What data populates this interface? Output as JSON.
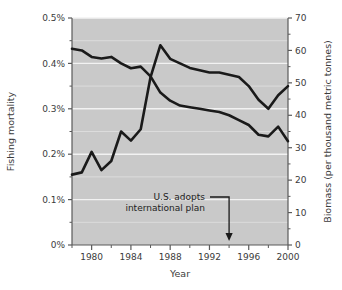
{
  "chart_data": {
    "type": "line",
    "title": "",
    "xlabel": "Year",
    "ylabel": "Fishing mortality",
    "y2label": "Biomass (per thousand metric tonnes)",
    "xlim": [
      1978,
      2000
    ],
    "ylim": [
      0,
      0.5
    ],
    "y2lim": [
      0,
      70
    ],
    "grid": true,
    "legend": "none",
    "xticks": [
      1980,
      1984,
      1988,
      1992,
      1996,
      2000
    ],
    "xtick_labels": [
      "1980",
      "1984",
      "1988",
      "1992",
      "1996",
      "2000"
    ],
    "xminor_ticks": [
      1978,
      1982,
      1986,
      1990,
      1994,
      1998
    ],
    "yticks": [
      0,
      0.1,
      0.2,
      0.3,
      0.4,
      0.5
    ],
    "ytick_labels": [
      "0%",
      "0.1%",
      "0.2%",
      "0.3%",
      "0.4%",
      "0.5%"
    ],
    "yminor_ticks": [
      0.05,
      0.15,
      0.25,
      0.35,
      0.45
    ],
    "y2ticks": [
      0,
      10,
      20,
      30,
      40,
      50,
      60,
      70
    ],
    "y2tick_labels": [
      "0",
      "10",
      "20",
      "30",
      "40",
      "50",
      "60",
      "70"
    ],
    "y2minor_ticks": [
      5,
      15,
      25,
      35,
      45,
      55,
      65
    ],
    "plot_bg": "#c9c9c9",
    "gridline_color": "#e8e8e8",
    "line_color": "#1a1a1a",
    "series": [
      {
        "name": "Fishing mortality",
        "axis": "left",
        "x": [
          1978,
          1979,
          1980,
          1981,
          1982,
          1983,
          1984,
          1985,
          1986,
          1987,
          1988,
          1989,
          1990,
          1991,
          1992,
          1993,
          1994,
          1995,
          1996,
          1997,
          1998,
          1999,
          2000
        ],
        "values": [
          0.155,
          0.16,
          0.205,
          0.165,
          0.185,
          0.25,
          0.23,
          0.255,
          0.37,
          0.44,
          0.41,
          0.4,
          0.39,
          0.385,
          0.38,
          0.38,
          0.375,
          0.37,
          0.35,
          0.32,
          0.3,
          0.33,
          0.35
        ]
      },
      {
        "name": "Biomass",
        "axis": "right",
        "x": [
          1978,
          1979,
          1980,
          1981,
          1982,
          1983,
          1984,
          1985,
          1986,
          1987,
          1988,
          1989,
          1990,
          1991,
          1992,
          1993,
          1994,
          1995,
          1996,
          1997,
          1998,
          1999,
          2000
        ],
        "values": [
          60.5,
          60.0,
          58.0,
          57.5,
          58.0,
          56.0,
          54.5,
          55.0,
          52.0,
          47.0,
          44.5,
          43.0,
          42.5,
          42.0,
          41.5,
          41.0,
          40.0,
          38.5,
          37.0,
          34.0,
          33.5,
          36.5,
          32.0
        ]
      }
    ],
    "annotations": [
      {
        "name": "us-adopts-plan",
        "line1": "U.S. adopts",
        "line2": "international plan",
        "target_x": 1994,
        "arrow": "down"
      }
    ]
  }
}
